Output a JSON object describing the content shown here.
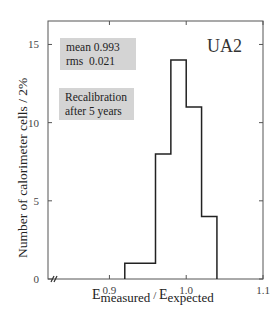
{
  "chart_data": {
    "type": "bar",
    "subtype": "histogram",
    "title": "UA2",
    "xlabel": "E_measured / E_expected",
    "xlabel_parts": {
      "main1": "E",
      "sub1": "measured",
      "sep": " / ",
      "main2": "E",
      "sub2": "expected"
    },
    "ylabel": "Number of calorimeter cells / 2%",
    "xlim": [
      0.82,
      1.1
    ],
    "ylim": [
      0,
      16.5
    ],
    "x_axis_break": true,
    "x_ticks": [
      "0.9",
      "1.0",
      "1.1"
    ],
    "y_ticks": [
      "0",
      "5",
      "10",
      "15"
    ],
    "bin_width": 0.02,
    "bins": [
      {
        "from": 0.92,
        "to": 0.94,
        "count": 1
      },
      {
        "from": 0.94,
        "to": 0.96,
        "count": 1
      },
      {
        "from": 0.96,
        "to": 0.98,
        "count": 8
      },
      {
        "from": 0.98,
        "to": 1.0,
        "count": 14
      },
      {
        "from": 1.0,
        "to": 1.02,
        "count": 11
      },
      {
        "from": 1.02,
        "to": 1.04,
        "count": 4
      }
    ],
    "categories": [
      "0.92-0.94",
      "0.94-0.96",
      "0.96-0.98",
      "0.98-1.00",
      "1.00-1.02",
      "1.02-1.04"
    ],
    "values": [
      1,
      1,
      8,
      14,
      11,
      4
    ],
    "grid": false,
    "annotations": {
      "stats": {
        "mean_label": "mean",
        "mean_value": "0.993",
        "rms_label": "rms",
        "rms_value": "0.021"
      },
      "note_line1": "Recalibration",
      "note_line2": "after 5 years"
    }
  }
}
